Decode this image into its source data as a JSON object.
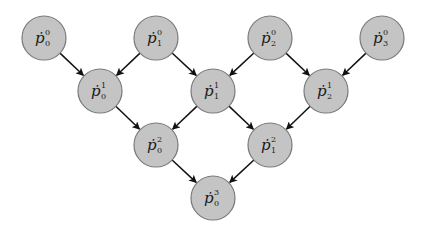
{
  "diagram": {
    "type": "directed-graph",
    "nodes": [
      {
        "id": "p0_0",
        "base": "ṗ",
        "sup": "0",
        "sub": "0",
        "x": 44,
        "y": 38
      },
      {
        "id": "p1_0",
        "base": "ṗ",
        "sup": "0",
        "sub": "1",
        "x": 156,
        "y": 38
      },
      {
        "id": "p2_0",
        "base": "ṗ",
        "sup": "0",
        "sub": "2",
        "x": 270,
        "y": 38
      },
      {
        "id": "p3_0",
        "base": "ṗ",
        "sup": "0",
        "sub": "3",
        "x": 382,
        "y": 38
      },
      {
        "id": "p0_1",
        "base": "ṗ",
        "sup": "1",
        "sub": "0",
        "x": 100,
        "y": 91
      },
      {
        "id": "p1_1",
        "base": "ṗ",
        "sup": "1",
        "sub": "1",
        "x": 213,
        "y": 91
      },
      {
        "id": "p2_1",
        "base": "ṗ",
        "sup": "1",
        "sub": "2",
        "x": 326,
        "y": 91
      },
      {
        "id": "p0_2",
        "base": "ṗ",
        "sup": "2",
        "sub": "0",
        "x": 156,
        "y": 145
      },
      {
        "id": "p1_2",
        "base": "ṗ",
        "sup": "2",
        "sub": "1",
        "x": 270,
        "y": 145
      },
      {
        "id": "p0_3",
        "base": "ṗ",
        "sup": "3",
        "sub": "0",
        "x": 213,
        "y": 198
      }
    ],
    "edges": [
      {
        "from": "p0_0",
        "to": "p0_1"
      },
      {
        "from": "p1_0",
        "to": "p0_1"
      },
      {
        "from": "p1_0",
        "to": "p1_1"
      },
      {
        "from": "p2_0",
        "to": "p1_1"
      },
      {
        "from": "p2_0",
        "to": "p2_1"
      },
      {
        "from": "p3_0",
        "to": "p2_1"
      },
      {
        "from": "p0_1",
        "to": "p0_2"
      },
      {
        "from": "p1_1",
        "to": "p0_2"
      },
      {
        "from": "p1_1",
        "to": "p1_2"
      },
      {
        "from": "p2_1",
        "to": "p1_2"
      },
      {
        "from": "p0_2",
        "to": "p0_3"
      },
      {
        "from": "p1_2",
        "to": "p0_3"
      }
    ],
    "style": {
      "node_fill": "#c4c4c4",
      "node_stroke": "#7a7a7a",
      "edge_color": "#111111",
      "node_radius": 22
    }
  }
}
